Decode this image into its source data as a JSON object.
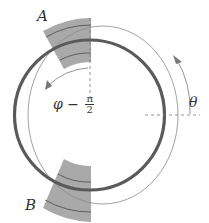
{
  "figure": {
    "labels": {
      "sector_a": "A",
      "sector_b": "B",
      "theta": "θ",
      "phi_expr": "φ −",
      "phi_frac_num": "π",
      "phi_frac_den": "2"
    },
    "colors": {
      "thick_ring": "#555555",
      "thin_ring": "#8a8a8a",
      "sector_fill": "#a8a8a8",
      "dashed": "#777777",
      "text": "#333333"
    }
  }
}
